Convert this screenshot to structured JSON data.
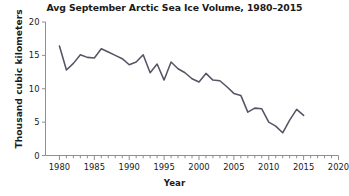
{
  "chart_data": {
    "type": "line",
    "title": "Avg September Arctic Sea Ice Volume, 1980–2015",
    "xlabel": "Year",
    "ylabel": "Thousand cubic kilometers",
    "xlim": [
      1978,
      2020
    ],
    "ylim": [
      0,
      20
    ],
    "grid": false,
    "legend": null,
    "x_major_ticks": [
      1980,
      1985,
      1990,
      1995,
      2000,
      2005,
      2010,
      2015,
      2020
    ],
    "x_major_tick_labels": [
      "1980",
      "1985",
      "1990",
      "1995",
      "2000",
      "2005",
      "2010",
      "2015",
      "2020"
    ],
    "x_minor_tick_interval": 1,
    "y_ticks": [
      0,
      5,
      10,
      15,
      20
    ],
    "y_tick_labels": [
      "0",
      "5",
      "10",
      "15",
      "20"
    ],
    "line_color": "#565465",
    "x": [
      1980,
      1981,
      1982,
      1983,
      1984,
      1985,
      1986,
      1987,
      1988,
      1989,
      1990,
      1991,
      1992,
      1993,
      1994,
      1995,
      1996,
      1997,
      1998,
      1999,
      2000,
      2001,
      2002,
      2003,
      2004,
      2005,
      2006,
      2007,
      2008,
      2009,
      2010,
      2011,
      2012,
      2013,
      2014,
      2015
    ],
    "series": [
      {
        "name": "Avg September Arctic Sea Ice Volume",
        "units": "thousand cubic kilometers",
        "values": [
          16.4,
          12.8,
          13.8,
          15.1,
          14.7,
          14.6,
          16.0,
          15.5,
          15.0,
          14.5,
          13.6,
          14.0,
          15.1,
          12.4,
          13.7,
          11.3,
          14.0,
          13.0,
          12.4,
          11.5,
          11.0,
          12.3,
          11.3,
          11.2,
          10.3,
          9.3,
          9.0,
          6.5,
          7.1,
          7.0,
          5.0,
          4.4,
          3.4,
          5.3,
          6.9,
          6.0
        ]
      }
    ]
  },
  "axes": {
    "title": "Avg September Arctic Sea Ice Volume, 1980–2015",
    "x_title": "Year",
    "y_title": "Thousand cubic kilometers"
  }
}
